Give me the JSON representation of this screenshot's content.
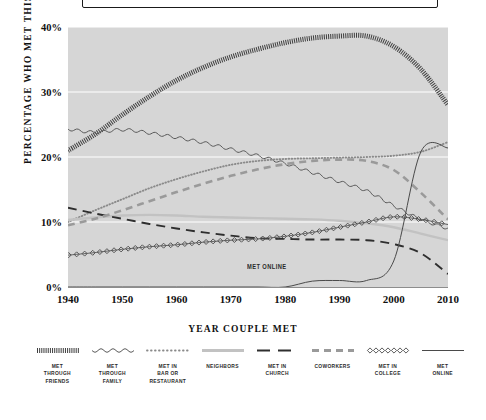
{
  "chart_data": {
    "type": "line",
    "title": "",
    "xlabel": "YEAR COUPLE MET",
    "ylabel": "PERCENTAGE WHO MET THIS WAY",
    "xlim": [
      1940,
      2010
    ],
    "ylim": [
      0,
      40
    ],
    "xticks": [
      "1940",
      "1950",
      "1960",
      "1970",
      "1980",
      "1990",
      "2000",
      "2010"
    ],
    "yticks": [
      "0%",
      "10%",
      "20%",
      "30%",
      "40%"
    ],
    "grid": "horizontal-white",
    "legend_position": "bottom",
    "annotations": [
      {
        "text": "MET ONLINE",
        "x": 1973,
        "y": 3.0
      }
    ],
    "x": [
      1940,
      1945,
      1950,
      1955,
      1960,
      1965,
      1970,
      1975,
      1980,
      1985,
      1990,
      1995,
      2000,
      2005,
      2010
    ],
    "series": [
      {
        "name": "MET THROUGH FRIENDS",
        "style": "hatched",
        "color": "#3f3f3f",
        "values": [
          21.0,
          23.5,
          26.5,
          29.3,
          31.8,
          33.8,
          35.4,
          36.6,
          37.6,
          38.3,
          38.6,
          38.6,
          37.0,
          33.5,
          28.0
        ]
      },
      {
        "name": "MET THROUGH FAMILY",
        "style": "wavy",
        "color": "#5a5a5a",
        "values": [
          24.3,
          23.8,
          24.2,
          23.7,
          23.0,
          22.2,
          21.2,
          20.2,
          19.0,
          17.6,
          16.2,
          14.8,
          12.5,
          10.4,
          9.0
        ]
      },
      {
        "name": "MET IN BAR OR RESTAURANT",
        "style": "dotted",
        "color": "#8a8a8a",
        "values": [
          10.0,
          11.8,
          13.5,
          15.2,
          16.6,
          17.8,
          18.8,
          19.4,
          19.7,
          19.8,
          19.9,
          20.0,
          20.2,
          20.8,
          22.3
        ]
      },
      {
        "name": "NEIGHBORS",
        "style": "solid-light",
        "color": "#c2c2c2",
        "values": [
          10.3,
          10.7,
          11.0,
          11.1,
          11.0,
          10.8,
          10.7,
          10.6,
          10.5,
          10.4,
          10.2,
          9.8,
          9.2,
          8.2,
          7.2
        ]
      },
      {
        "name": "MET IN CHURCH",
        "style": "long-dash",
        "color": "#2e2e2e",
        "values": [
          12.2,
          11.3,
          10.5,
          9.7,
          9.0,
          8.4,
          7.9,
          7.5,
          7.4,
          7.3,
          7.3,
          7.2,
          6.6,
          5.2,
          2.0
        ]
      },
      {
        "name": "COWORKERS",
        "style": "med-dash",
        "color": "#9a9a9a",
        "values": [
          9.5,
          10.5,
          11.8,
          13.2,
          14.6,
          15.9,
          17.1,
          18.1,
          18.9,
          19.4,
          19.6,
          19.4,
          18.0,
          14.5,
          10.4
        ]
      },
      {
        "name": "MET IN COLLEGE",
        "style": "diamonds",
        "color": "#4a4a4a",
        "values": [
          4.9,
          5.3,
          5.8,
          6.2,
          6.5,
          6.9,
          7.2,
          7.4,
          7.8,
          8.4,
          9.2,
          10.0,
          10.8,
          10.4,
          9.6
        ]
      },
      {
        "name": "MET ONLINE",
        "style": "thin-solid",
        "color": "#4a4a4a",
        "values": [
          0.0,
          0.0,
          0.0,
          0.0,
          0.0,
          0.0,
          0.0,
          0.0,
          0.0,
          0.9,
          1.0,
          1.0,
          4.0,
          20.8,
          21.4
        ]
      }
    ]
  },
  "legend": {
    "items": [
      {
        "label": "MET\nTHROUGH\nFRIENDS",
        "swatch": "hatched-swatch"
      },
      {
        "label": "MET\nTHROUGH\nFAMILY",
        "swatch": "wavy-swatch"
      },
      {
        "label": "MET IN\nBAR OR\nRESTAURANT",
        "swatch": "dotted-swatch"
      },
      {
        "label": "NEIGHBORS",
        "swatch": "solid-light-swatch"
      },
      {
        "label": "MET IN\nCHURCH",
        "swatch": "long-dash-swatch"
      },
      {
        "label": "COWORKERS",
        "swatch": "med-dash-swatch"
      },
      {
        "label": "MET IN\nCOLLEGE",
        "swatch": "diamonds-swatch"
      },
      {
        "label": "MET\nONLINE",
        "swatch": "thin-solid-swatch"
      }
    ]
  },
  "colors": {
    "plot_background": "#d6d6d6",
    "gridline": "#ffffff",
    "axis": "#8d8d8d",
    "text": "#111111"
  }
}
